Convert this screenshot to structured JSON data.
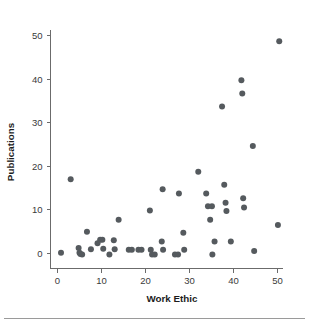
{
  "chart_data": {
    "type": "scatter",
    "title": "",
    "subtitle": "",
    "xlabel": "Work Ethic",
    "ylabel": "Publications",
    "xlim": [
      -1.5,
      53.5
    ],
    "ylim": [
      -3.5,
      53.0
    ],
    "xticks": [
      0,
      10,
      20,
      30,
      40,
      50
    ],
    "yticks": [
      0,
      10,
      20,
      30,
      40,
      50
    ],
    "xtick_labels": [
      "0",
      "10",
      "20",
      "30",
      "40",
      "50"
    ],
    "ytick_labels": [
      "0",
      "10",
      "20",
      "30",
      "40",
      "50"
    ],
    "grid": false,
    "legend": false,
    "legend_position": "none",
    "marker": "circle",
    "marker_color": "#555a5e",
    "marker_size": 3.0,
    "series": [
      {
        "name": "observations",
        "points": [
          [
            1.0,
            0.0
          ],
          [
            3.2,
            16.9
          ],
          [
            5.0,
            1.1
          ],
          [
            5.2,
            0.0
          ],
          [
            5.4,
            -0.3
          ],
          [
            5.8,
            -0.4
          ],
          [
            6.9,
            4.8
          ],
          [
            7.8,
            0.8
          ],
          [
            9.3,
            2.2
          ],
          [
            9.9,
            3.0
          ],
          [
            10.4,
            3.0
          ],
          [
            10.6,
            0.9
          ],
          [
            12.0,
            -0.4
          ],
          [
            13.0,
            2.9
          ],
          [
            13.2,
            0.8
          ],
          [
            14.1,
            7.6
          ],
          [
            16.4,
            0.7
          ],
          [
            17.1,
            0.7
          ],
          [
            18.6,
            0.7
          ],
          [
            19.3,
            0.7
          ],
          [
            21.2,
            9.7
          ],
          [
            21.4,
            0.7
          ],
          [
            21.7,
            -0.4
          ],
          [
            22.3,
            -0.4
          ],
          [
            23.9,
            2.6
          ],
          [
            24.1,
            14.6
          ],
          [
            24.2,
            0.7
          ],
          [
            26.9,
            -0.4
          ],
          [
            27.6,
            -0.4
          ],
          [
            27.8,
            13.6
          ],
          [
            28.8,
            4.6
          ],
          [
            29.0,
            0.7
          ],
          [
            32.2,
            18.6
          ],
          [
            34.0,
            13.6
          ],
          [
            34.4,
            10.7
          ],
          [
            34.9,
            7.6
          ],
          [
            35.3,
            10.7
          ],
          [
            35.4,
            -0.4
          ],
          [
            35.9,
            2.6
          ],
          [
            37.6,
            33.6
          ],
          [
            38.1,
            15.6
          ],
          [
            38.4,
            11.5
          ],
          [
            38.6,
            9.6
          ],
          [
            39.6,
            2.6
          ],
          [
            42.0,
            39.6
          ],
          [
            42.2,
            36.6
          ],
          [
            42.4,
            12.5
          ],
          [
            42.6,
            10.4
          ],
          [
            44.6,
            24.5
          ],
          [
            44.9,
            0.4
          ],
          [
            50.3,
            6.4
          ],
          [
            50.6,
            48.6
          ]
        ]
      }
    ]
  },
  "axes": {
    "y_title": "Publications",
    "x_title": "Work Ethic"
  },
  "figure": {
    "background_color": "#ffffff",
    "axis_color": "#6b6b6b",
    "text_color": "#1c1c1c",
    "rule_color": "#9a9a9a"
  }
}
